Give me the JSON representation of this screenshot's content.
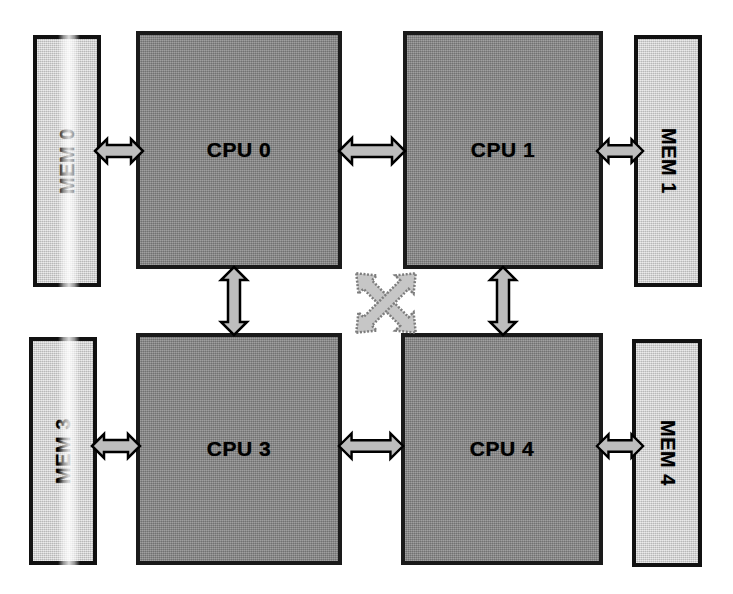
{
  "diagram": {
    "type": "block-diagram",
    "background_color": "#ffffff",
    "cpu_fill_color": "#8b8b8b",
    "mem_fill_color": "#d2d2d2",
    "arrow_fill_color": "#bdbdbd",
    "border_color": "#111111"
  },
  "cpus": [
    {
      "id": "cpu0",
      "label": "CPU 0",
      "position": "top-left"
    },
    {
      "id": "cpu1",
      "label": "CPU 1",
      "position": "top-right"
    },
    {
      "id": "cpu3",
      "label": "CPU 3",
      "position": "bottom-left"
    },
    {
      "id": "cpu4",
      "label": "CPU 4",
      "position": "bottom-right"
    }
  ],
  "memories": [
    {
      "id": "mem0",
      "label": "MEM 0",
      "position": "outer-left-top",
      "text_direction": "bottom-to-top"
    },
    {
      "id": "mem1",
      "label": "MEM 1",
      "position": "outer-right-top",
      "text_direction": "top-to-bottom"
    },
    {
      "id": "mem3",
      "label": "MEM 3",
      "position": "outer-left-bottom",
      "text_direction": "bottom-to-top"
    },
    {
      "id": "mem4",
      "label": "MEM 4",
      "position": "outer-right-bottom",
      "text_direction": "top-to-bottom"
    }
  ],
  "connections": [
    {
      "id": "link-mem0-cpu0",
      "from": "MEM 0",
      "to": "CPU 0",
      "style": "double-headed",
      "orientation": "horizontal"
    },
    {
      "id": "link-cpu1-mem1",
      "from": "CPU 1",
      "to": "MEM 1",
      "style": "double-headed",
      "orientation": "horizontal"
    },
    {
      "id": "link-mem3-cpu3",
      "from": "MEM 3",
      "to": "CPU 3",
      "style": "double-headed",
      "orientation": "horizontal"
    },
    {
      "id": "link-cpu4-mem4",
      "from": "CPU 4",
      "to": "MEM 4",
      "style": "double-headed",
      "orientation": "horizontal"
    },
    {
      "id": "link-cpu0-cpu1",
      "from": "CPU 0",
      "to": "CPU 1",
      "style": "double-headed",
      "orientation": "horizontal"
    },
    {
      "id": "link-cpu3-cpu4",
      "from": "CPU 3",
      "to": "CPU 4",
      "style": "double-headed",
      "orientation": "horizontal"
    },
    {
      "id": "link-cpu0-cpu3",
      "from": "CPU 0",
      "to": "CPU 3",
      "style": "double-headed",
      "orientation": "vertical"
    },
    {
      "id": "link-cpu1-cpu4",
      "from": "CPU 1",
      "to": "CPU 4",
      "style": "double-headed",
      "orientation": "vertical"
    },
    {
      "id": "link-cpu0-cpu4",
      "from": "CPU 0",
      "to": "CPU 4",
      "style": "double-headed",
      "orientation": "diagonal-down-right"
    },
    {
      "id": "link-cpu1-cpu3",
      "from": "CPU 1",
      "to": "CPU 3",
      "style": "double-headed",
      "orientation": "diagonal-down-left"
    }
  ]
}
